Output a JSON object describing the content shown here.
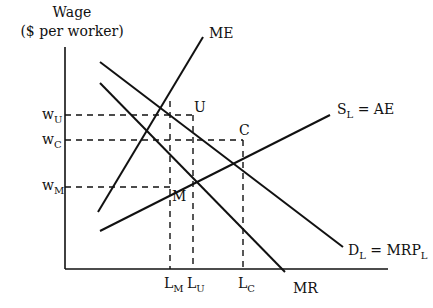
{
  "diagram": {
    "type": "monopsony-union-labor-market",
    "y_axis": {
      "title_line1": "Wage",
      "title_line2": "($ per worker)"
    },
    "x_axis": {
      "title": ""
    },
    "wage_levels": [
      {
        "id": "wU",
        "base": "w",
        "sub": "U"
      },
      {
        "id": "wC",
        "base": "w",
        "sub": "C"
      },
      {
        "id": "wM",
        "base": "w",
        "sub": "M"
      }
    ],
    "quantity_levels": [
      {
        "id": "LM",
        "base": "L",
        "sub": "M"
      },
      {
        "id": "LU",
        "base": "L",
        "sub": "U"
      },
      {
        "id": "LC",
        "base": "L",
        "sub": "C"
      }
    ],
    "curves": {
      "ME": {
        "label": "ME"
      },
      "MR": {
        "label": "MR"
      },
      "supply": {
        "base": "S",
        "sub": "L",
        "rest": " = AE"
      },
      "demand": {
        "base": "D",
        "sub": "L",
        "mid": " = MRP",
        "sub2": "L"
      }
    },
    "points": {
      "U": "U",
      "C": "C",
      "M": "M"
    }
  }
}
